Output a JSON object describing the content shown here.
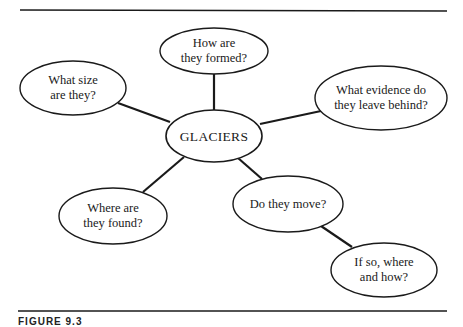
{
  "diagram": {
    "center": {
      "label": "GLACIERS"
    },
    "nodes": [
      {
        "id": "formed",
        "label": "How are\nthey formed?"
      },
      {
        "id": "size",
        "label": "What size\nare they?"
      },
      {
        "id": "evidence",
        "label": "What evidence do\nthey leave behind?"
      },
      {
        "id": "found",
        "label": "Where are\nthey found?"
      },
      {
        "id": "move",
        "label": "Do they move?"
      },
      {
        "id": "where-how",
        "label": "If so, where\nand how?"
      }
    ]
  },
  "caption": {
    "text": "FIGURE 9.3"
  },
  "colors": {
    "ink": "#1a1a1a",
    "background": "#ffffff"
  }
}
